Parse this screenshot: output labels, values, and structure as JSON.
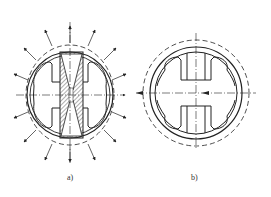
{
  "figure": {
    "panels": [
      {
        "id": "a",
        "label": "a)",
        "center": [
          70,
          95
        ],
        "outer_radius": 43,
        "inner_radius": 40,
        "deformed_dashed_radius": 50,
        "arrows": "radial outward expansion arrows",
        "hatched_insert": true
      },
      {
        "id": "b",
        "label": "b)",
        "center": [
          196,
          93
        ],
        "outer_radius": 46,
        "inner_radius": 41,
        "dashed_radius": 53,
        "hatched_insert": false
      }
    ],
    "line_color": "#222222",
    "background": "#ffffff"
  }
}
